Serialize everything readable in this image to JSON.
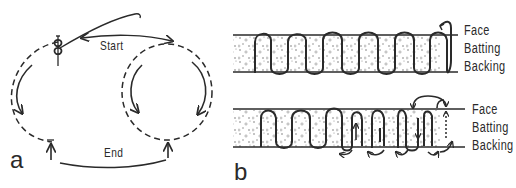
{
  "panel_a": {
    "letter": "a",
    "start_label": "Start",
    "end_label": "End",
    "elements": [
      "needle-with-thread",
      "dashed-left-loop",
      "dashed-right-loop",
      "curved-direction-arrows",
      "start-arrow",
      "end-arc"
    ]
  },
  "panel_b": {
    "letter": "b",
    "top_diagram": {
      "layers": [
        {
          "name": "Face"
        },
        {
          "name": "Batting"
        },
        {
          "name": "Backing"
        }
      ],
      "stitch": "continuous serpentine running stitch through all layers"
    },
    "bottom_diagram": {
      "layers": [
        {
          "name": "Face"
        },
        {
          "name": "Batting"
        },
        {
          "name": "Backing"
        }
      ],
      "stitch": "back-tracking stitch with directional arrows"
    }
  },
  "colors": {
    "ink": "#2a2a2a",
    "background": "#ffffff",
    "stipple": "#7a7a7a"
  }
}
